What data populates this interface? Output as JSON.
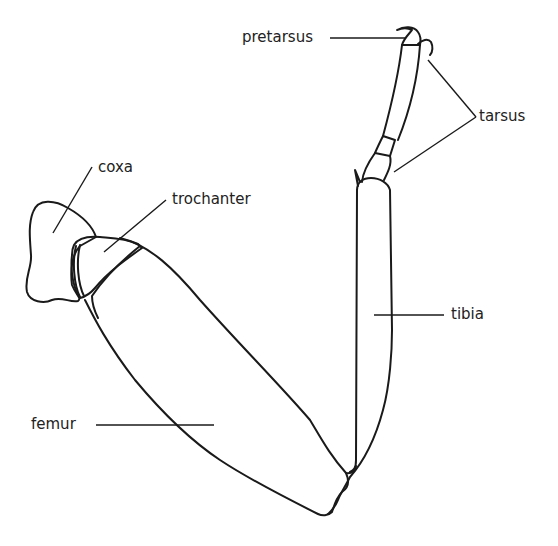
{
  "diagram": {
    "labels": {
      "pretarsus": "pretarsus",
      "tarsus": "tarsus",
      "coxa": "coxa",
      "trochanter": "trochanter",
      "tibia": "tibia",
      "femur": "femur"
    },
    "colors": {
      "line": "#1a1a1a",
      "background": "#ffffff",
      "text": "#222222"
    }
  }
}
